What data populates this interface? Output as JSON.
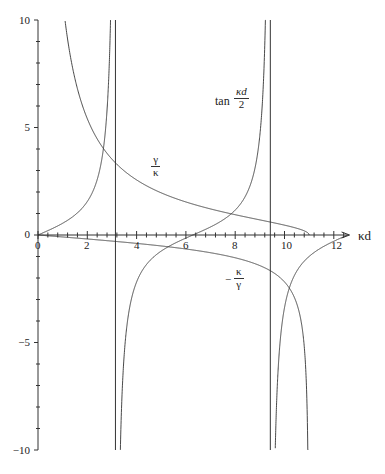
{
  "chart_data": {
    "type": "line",
    "title": "",
    "xlabel": "κd",
    "ylabel": "",
    "xlim": [
      0,
      12.7
    ],
    "ylim": [
      -10,
      10
    ],
    "grid": false,
    "x_ticks": [
      0,
      2,
      4,
      6,
      8,
      10,
      12
    ],
    "x_minor_step": 0.4,
    "y_ticks": [
      -10,
      -5,
      0,
      5,
      10
    ],
    "y_minor_step": 1,
    "kappa0_d": 11,
    "series": [
      {
        "name": "tan κd/2",
        "expression": "tan(x/2)",
        "domain": [
          0,
          12.7
        ],
        "asymptotes": [
          3.1416,
          9.4248
        ]
      },
      {
        "name": "γ/κ",
        "expression": "sqrt(121 - x^2)/x",
        "domain": [
          1.1,
          11
        ]
      },
      {
        "name": "−κ/γ",
        "expression": "-x/sqrt(121 - x^2)",
        "domain": [
          0,
          10.95
        ]
      }
    ],
    "vertical_lines": [
      3.1416,
      9.4248
    ],
    "annotations": [
      {
        "text": "tan κd/2",
        "x": 7.8,
        "y": 6.6
      },
      {
        "text": "γ/κ",
        "x": 4.9,
        "y": 3.0
      },
      {
        "text": "−κ/γ",
        "x": 8.0,
        "y": -1.9
      }
    ]
  },
  "labels": {
    "xaxis": "κd",
    "tan_prefix": "tan",
    "tan_num": "κd",
    "tan_den": "2",
    "gk_num": "γ",
    "gk_den": "κ",
    "kg_sign": "−",
    "kg_num": "κ",
    "kg_den": "γ"
  },
  "tick_labels": {
    "x": [
      "0",
      "2",
      "4",
      "6",
      "8",
      "10",
      "12"
    ],
    "y": [
      "10",
      "5",
      "0",
      "−5",
      "−10"
    ]
  }
}
